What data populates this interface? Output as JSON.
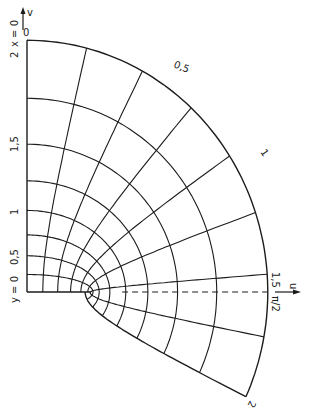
{
  "figure": {
    "colors": {
      "line": "#1c1c1c",
      "background": "#ffffff"
    }
  },
  "axes": {
    "vertical_axis_label": "v",
    "horizontal_axis_label": "u",
    "left_edge_top_label": "x = 0",
    "left_edge_bottom_label": "y = 0",
    "pi_half_label": "π/2"
  },
  "left_ticks": [
    {
      "label": "0",
      "u": 0
    },
    {
      "label": "0,5",
      "u": 0.5
    },
    {
      "label": "1",
      "u": 1
    },
    {
      "label": "1,5",
      "u": 1.5
    },
    {
      "label": "2",
      "u": 2
    }
  ],
  "arc_labels": [
    {
      "label": "0",
      "theta": 0
    },
    {
      "label": "0,5",
      "theta": 0.5
    },
    {
      "label": "1",
      "theta": 1
    },
    {
      "label": "1,5",
      "theta": 1.5
    },
    {
      "label": "2",
      "theta": 2
    }
  ],
  "grid": {
    "u_levels": [
      0.25,
      0.5,
      0.75,
      1.0,
      1.25,
      1.5,
      1.75,
      2.0
    ],
    "theta_levels": [
      0.25,
      0.5,
      0.75,
      1.0,
      1.25,
      1.5,
      1.75,
      2.0
    ],
    "theta_dashed": 1.5708,
    "u_max": 2.0,
    "theta_max": 2.0
  }
}
